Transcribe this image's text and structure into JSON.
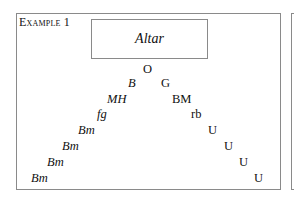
{
  "caption": "Example 1",
  "altar_label": "Altar",
  "apex": "O",
  "left_branch": [
    "B",
    "MH",
    "fg",
    "Bm",
    "Bm",
    "Bm",
    "Bm"
  ],
  "right_branch": [
    "G",
    "BM",
    "rb",
    "U",
    "U",
    "U",
    "U"
  ]
}
